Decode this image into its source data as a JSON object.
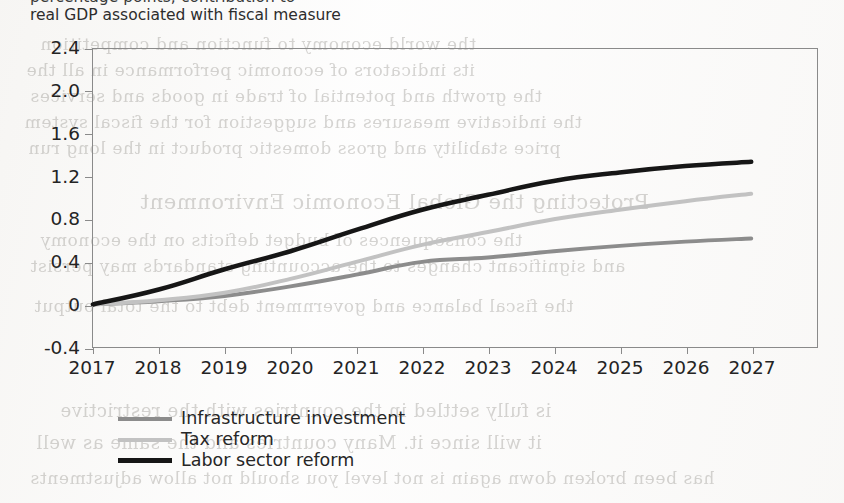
{
  "subtitle": "real GDP associated with fiscal measure",
  "subtitle_clipped_above": "percentage points; contribution to",
  "ghost_text": [
    {
      "t": "the world economy to function and competition",
      "x": 40,
      "y": 34,
      "s": 17
    },
    {
      "t": "its indicators of economic performance in all the",
      "x": 26,
      "y": 60,
      "s": 17
    },
    {
      "t": "the growth and potential of trade in goods and services",
      "x": 30,
      "y": 86,
      "s": 17
    },
    {
      "t": "the indicative measures and suggestion for the fiscal system",
      "x": 24,
      "y": 112,
      "s": 17
    },
    {
      "t": "price stability and gross domestic product in the long run",
      "x": 28,
      "y": 138,
      "s": 17
    },
    {
      "t": "Protecting the Global Economic Environment",
      "x": 140,
      "y": 190,
      "s": 21
    },
    {
      "t": "the consequences of budget deficits on the economy",
      "x": 40,
      "y": 230,
      "s": 17
    },
    {
      "t": "and significant changes to the accounting standards may persist",
      "x": 30,
      "y": 256,
      "s": 17
    },
    {
      "t": "the fiscal balance and government debt to the total output",
      "x": 34,
      "y": 296,
      "s": 17
    },
    {
      "t": "is fully settled in the countries with the restrictive",
      "x": 60,
      "y": 400,
      "s": 18
    },
    {
      "t": "it will since it. Many countries and the same as well",
      "x": 36,
      "y": 432,
      "s": 18
    },
    {
      "t": "has been broken down again is not level you should not allow adjustments",
      "x": 30,
      "y": 468,
      "s": 17
    }
  ],
  "chart_data": {
    "type": "line",
    "title": "",
    "subtitle": "real GDP associated with fiscal measure",
    "xlabel": "",
    "ylabel": "",
    "ylim": [
      -0.4,
      2.4
    ],
    "yticks": [
      "-0.4",
      "0",
      "0.4",
      "0.8",
      "1.2",
      "1.6",
      "2.0",
      "2.4"
    ],
    "ytick_values": [
      -0.4,
      0,
      0.4,
      0.8,
      1.2,
      1.6,
      2.0,
      2.4
    ],
    "grid": false,
    "legend_position": "below-left",
    "x": [
      "2017",
      "2018",
      "2019",
      "2020",
      "2021",
      "2022",
      "2023",
      "2024",
      "2025",
      "2026",
      "2027"
    ],
    "series": [
      {
        "name": "Infrastructure investment",
        "color": "#8c8c8c",
        "width": 4.0,
        "values": [
          0.0,
          0.03,
          0.08,
          0.17,
          0.28,
          0.4,
          0.44,
          0.5,
          0.55,
          0.59,
          0.62
        ]
      },
      {
        "name": "Tax reform",
        "color": "#c2c2c2",
        "width": 4.0,
        "values": [
          0.0,
          0.04,
          0.11,
          0.24,
          0.4,
          0.56,
          0.68,
          0.8,
          0.89,
          0.97,
          1.04
        ]
      },
      {
        "name": "Labor sector reform",
        "color": "#161616",
        "width": 4.6,
        "values": [
          0.0,
          0.14,
          0.33,
          0.5,
          0.7,
          0.89,
          1.03,
          1.16,
          1.24,
          1.3,
          1.34
        ]
      }
    ]
  }
}
